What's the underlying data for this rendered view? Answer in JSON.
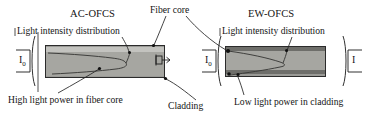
{
  "figure": {
    "background_color": "#ffffff",
    "line_color": "#242424",
    "fiber_fill_color": "#9a9a96",
    "cladding_color": "#6e6e6a",
    "core_highlight_color": "#c3c3bf"
  },
  "panels": [
    {
      "id": "ac-ofcs",
      "title": "AC-OFCS",
      "intensity_label": "Light intensity distribution",
      "input_label": "I",
      "input_subscript": "0",
      "output_label": "",
      "output_subscript": "",
      "description": "High light power in fiber core"
    },
    {
      "id": "ew-ofcs",
      "title": "EW-OFCS",
      "intensity_label": "Light intensity distribution",
      "input_label": "I",
      "input_subscript": "0",
      "output_label": "I",
      "output_subscript": "",
      "description": "Low light power in cladding"
    }
  ],
  "callouts": {
    "fiber_core": "Fiber core",
    "cladding": "Cladding",
    "high_power": "High light power in fiber core",
    "low_power": "Low light power in cladding"
  },
  "icons": {
    "light_exit_arrow": "light-exit-arrow-icon"
  }
}
